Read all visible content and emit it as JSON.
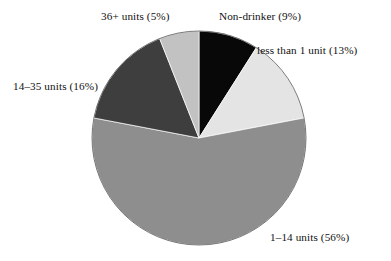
{
  "chart_data": {
    "type": "pie",
    "title": "",
    "subtitle": "",
    "xlabel": "",
    "ylabel": "",
    "legend_position": "none",
    "grid": false,
    "labels_outside": true,
    "start_angle_deg": 0,
    "direction": "clockwise",
    "categories": [
      "Non-drinker",
      "less than 1 unit",
      "1–14 units",
      "14–35 units",
      "36+ units"
    ],
    "values": [
      9,
      13,
      56,
      16,
      5
    ],
    "value_unit": "percent",
    "colors": [
      "#080808",
      "#e4e4e4",
      "#8e8e8e",
      "#3e3e3e",
      "#c2c2c2"
    ],
    "slices": [
      {
        "name": "non-drinker",
        "category": "Non-drinker",
        "value": 9,
        "percent_text": "(9%)",
        "label": "Non-drinker (9%)",
        "color": "#080808",
        "start_angle_deg": 0,
        "end_angle_deg": 32.4
      },
      {
        "name": "less-than-1-unit",
        "category": "less than 1 unit",
        "value": 13,
        "percent_text": "(13%)",
        "label": "less than 1 unit (13%)",
        "color": "#e4e4e4",
        "start_angle_deg": 32.4,
        "end_angle_deg": 79.2
      },
      {
        "name": "1-14-units",
        "category": "1–14 units",
        "value": 56,
        "percent_text": "(56%)",
        "label": "1–14 units (56%)",
        "color": "#8e8e8e",
        "start_angle_deg": 79.2,
        "end_angle_deg": 280.8
      },
      {
        "name": "14-35-units",
        "category": "14–35 units",
        "value": 16,
        "percent_text": "(16%)",
        "label": "14–35 units (16%)",
        "color": "#3e3e3e",
        "start_angle_deg": 280.8,
        "end_angle_deg": 338.4
      },
      {
        "name": "36-plus-units",
        "category": "36+ units",
        "value": 5,
        "percent_text": "(5%)",
        "label": "36+ units (5%)",
        "color": "#c2c2c2",
        "start_angle_deg": 338.4,
        "end_angle_deg": 360
      }
    ],
    "geometry": {
      "center_x": 199,
      "center_y": 138,
      "radius": 107
    }
  }
}
